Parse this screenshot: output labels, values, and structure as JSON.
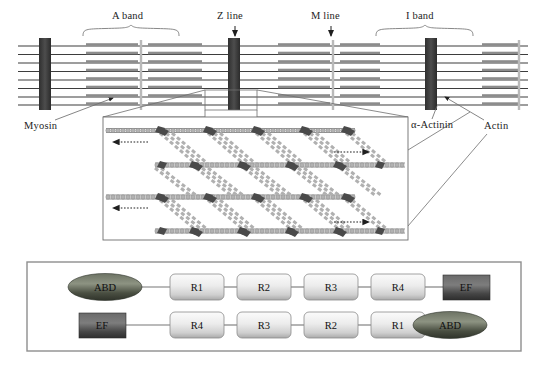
{
  "figure": {
    "type": "diagram"
  },
  "top_panel": {
    "name": "myofibril-band-schematic",
    "labels": [
      {
        "id": "a-band",
        "text": "A band",
        "x": 131,
        "y": 18,
        "marker": "brace"
      },
      {
        "id": "z-line",
        "text": "Z line",
        "x": 236,
        "y": 18,
        "marker": "arrow"
      },
      {
        "id": "m-line",
        "text": "M line",
        "x": 330,
        "y": 18,
        "marker": "arrow"
      },
      {
        "id": "i-band",
        "text": "I band",
        "x": 424,
        "y": 18,
        "marker": "brace"
      }
    ],
    "callouts": [
      {
        "id": "myosin",
        "text": "Myosin",
        "x": 24,
        "y": 126
      },
      {
        "id": "alpha-actinin",
        "text": "α-Actinin",
        "x": 412,
        "y": 126
      },
      {
        "id": "actin",
        "text": "Actin",
        "x": 486,
        "y": 127
      }
    ],
    "colors": {
      "z_line": "#3a3a3a",
      "m_line": "#b9b9b9",
      "myosin_filament": "#8c8c8c",
      "actin_filament": "#4a4a4a",
      "leader_line": "#6f6f6f"
    },
    "z_line_positions_px": [
      48,
      232,
      430
    ],
    "m_line_positions_px": [
      138,
      330
    ],
    "filament_rows": 8
  },
  "inset_panel": {
    "name": "sarcomere-crossbridge-inset",
    "box": {
      "x": 103,
      "y": 117,
      "w": 305,
      "h": 123
    },
    "colors": {
      "border": "#6e6e6e",
      "actin_bead": "#9a9a9a",
      "myosin_head": "#4a4a4a",
      "myosin_rod": "#a8a8a8"
    },
    "sliding_arrows": [
      {
        "id": "arrow-left-top",
        "direction": "left",
        "x": 112,
        "y": 148
      },
      {
        "id": "arrow-right-top",
        "direction": "right",
        "x": 355,
        "y": 152
      },
      {
        "id": "arrow-left-bottom",
        "direction": "left",
        "x": 112,
        "y": 212
      },
      {
        "id": "arrow-right-bottom",
        "direction": "right",
        "x": 355,
        "y": 222
      }
    ],
    "actin_rows": 4,
    "crossbridge_columns": 5
  },
  "bottom_panel": {
    "name": "alpha-actinin-antiparallel-dimer",
    "box": {
      "x": 27,
      "y": 262,
      "w": 494,
      "h": 89
    },
    "colors": {
      "border": "#8e8e8e",
      "abd_fill_dark": "#3f4438",
      "abd_fill_light": "#8d9382",
      "ef_fill_dark": "#3b3b3b",
      "ef_fill_light": "#7d7d7d",
      "repeat_fill_light": "#f2f2f2",
      "repeat_fill_dark": "#b4b4b4",
      "linker": "#777777"
    },
    "chains": [
      {
        "id": "chain-top",
        "direction": "n-to-c",
        "elements": [
          {
            "kind": "abd",
            "label": "ABD",
            "shape": "ellipse"
          },
          {
            "kind": "repeat",
            "label": "R1",
            "shape": "rounded-rect"
          },
          {
            "kind": "repeat",
            "label": "R2",
            "shape": "rounded-rect"
          },
          {
            "kind": "repeat",
            "label": "R3",
            "shape": "rounded-rect"
          },
          {
            "kind": "repeat",
            "label": "R4",
            "shape": "rounded-rect"
          },
          {
            "kind": "ef",
            "label": "EF",
            "shape": "rect"
          }
        ]
      },
      {
        "id": "chain-bottom",
        "direction": "c-to-n",
        "elements": [
          {
            "kind": "ef",
            "label": "EF",
            "shape": "rect"
          },
          {
            "kind": "repeat",
            "label": "R4",
            "shape": "rounded-rect"
          },
          {
            "kind": "repeat",
            "label": "R3",
            "shape": "rounded-rect"
          },
          {
            "kind": "repeat",
            "label": "R2",
            "shape": "rounded-rect"
          },
          {
            "kind": "repeat",
            "label": "R1",
            "shape": "rounded-rect"
          },
          {
            "kind": "abd",
            "label": "ABD",
            "shape": "ellipse"
          }
        ]
      }
    ]
  }
}
